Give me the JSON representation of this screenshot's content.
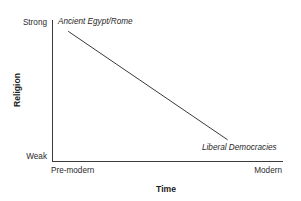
{
  "chart_data": {
    "type": "line",
    "title": "",
    "xlabel": "Time",
    "ylabel": "Religion",
    "grid": false,
    "legend": "none",
    "x_tick_labels": [
      "Pre-modern",
      "Modern"
    ],
    "y_tick_labels": [
      "Weak",
      "Strong"
    ],
    "xlim": [
      "Pre-modern",
      "Modern"
    ],
    "ylim": [
      "Weak",
      "Strong"
    ],
    "series": [
      {
        "name": "Religiosity over time",
        "x": [
          "Pre-modern",
          "Modern"
        ],
        "values": [
          "Strong",
          "Weak"
        ],
        "points": [
          {
            "label": "Ancient Egypt/Rome",
            "x": 0.07,
            "y": 0.92
          },
          {
            "label": "Liberal Democracies",
            "x": 0.76,
            "y": 0.15
          }
        ],
        "color": "#3a3a3a"
      }
    ],
    "annotations": [
      {
        "name": "start-label",
        "text": "Ancient Egypt/Rome"
      },
      {
        "name": "end-label",
        "text": "Liberal Democracies"
      }
    ]
  },
  "axes": {
    "y": {
      "title": "Religion",
      "tick_top": "Strong",
      "tick_bottom": "Weak"
    },
    "x": {
      "title": "Time",
      "tick_left": "Pre-modern",
      "tick_right": "Modern"
    }
  },
  "colors": {
    "line": "#3a3a3a",
    "axis": "#3a3a3a",
    "text": "#1f1f1f",
    "background": "#ffffff"
  }
}
